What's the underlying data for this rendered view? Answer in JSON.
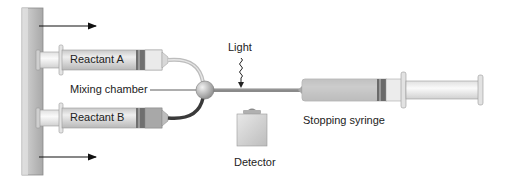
{
  "diagram": {
    "labels": {
      "reactant_a": "Reactant A",
      "reactant_b": "Reactant B",
      "mixing_chamber": "Mixing chamber",
      "light": "Light",
      "detector": "Detector",
      "stopping_syringe": "Stopping syringe"
    },
    "colors": {
      "wall": "#b9b9b9",
      "barrel": "#d9d9d9",
      "plunger": "#eeeeee",
      "seal": "#707070",
      "tube": "#8a8a8a",
      "dark_tube": "#3a3a3a",
      "detector": "#d4d4d4",
      "arrow": "#111111"
    }
  }
}
